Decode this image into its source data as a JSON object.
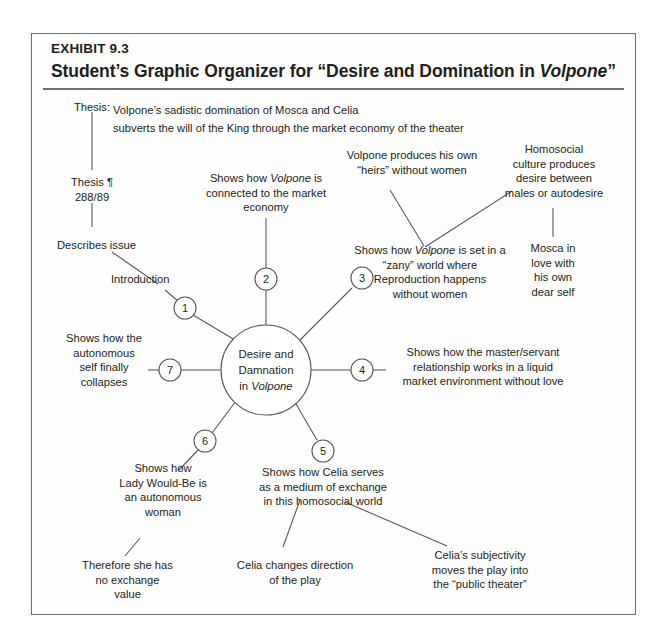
{
  "exhibit": {
    "label": "EXHIBIT 9.3",
    "title_prefix": "Student’s Graphic Organizer for “Desire and Domination in ",
    "title_italic": "Volpone",
    "title_suffix": "”"
  },
  "thesis": {
    "caption": "Thesis:",
    "text": "Volpone’s sadistic domination of Mosca and Celia\nsubverts the will of the King through the market economy of the theater"
  },
  "center": {
    "line1": "Desire and",
    "line2": "Damnation",
    "line3_prefix": "in ",
    "line3_italic": "Volpone"
  },
  "nodes": [
    {
      "num": "1",
      "label": "Introduction"
    },
    {
      "num": "2",
      "label": "Shows how Volpone is\nconnected to the market\neconomy"
    },
    {
      "num": "3",
      "label": "Shows how Volpone is set in a\n“zany” world where\nReproduction happens\nwithout women"
    },
    {
      "num": "4",
      "label": "Shows how the master/servant\nrelationship works in a liquid\nmarket environment without love"
    },
    {
      "num": "5",
      "label": "Shows how Celia serves\nas a medium of exchange\nin this homosocial world"
    },
    {
      "num": "6",
      "label": "Shows how\nLady Would-Be is\nan autonomous\nwoman"
    },
    {
      "num": "7",
      "label": "Shows how the\nautonomous\nself finally\ncollapses"
    }
  ],
  "labels": {
    "thesis_para": "Thesis ¶\n288/89",
    "describes_issue": "Describes issue",
    "introduction": "Introduction",
    "branch2_l1": "Shows how ",
    "branch2_i": "Volpone",
    "branch2_l2": " is",
    "branch2_rest": "connected to the market\neconomy",
    "volpone_heirs": "Volpone produces his own\n“heirs” without women",
    "homosocial": "Homosocial\nculture  produces\ndesire between\nmales or autodesire",
    "branch3_pre": "Shows how ",
    "branch3_i": "Volpone",
    "branch3_post": " is set in a",
    "branch3_rest": "“zany” world where\nReproduction happens\nwithout women",
    "mosca": "Mosca in\nlove with\nhis own\ndear self",
    "branch4": "Shows how the master/servant\nrelationship works in a liquid\nmarket environment without love",
    "branch5": "Shows how Celia serves\nas a medium of exchange\nin this homosocial world",
    "branch6": "Shows how\nLady Would-Be is\nan autonomous\nwoman",
    "branch7": "Shows how the\nautonomous\nself finally\ncollapses",
    "therefore": "Therefore she has\nno exchange\nvalue",
    "celia_changes": "Celia changes direction\nof the play",
    "celia_subjectivity": "Celia’s  subjectivity\nmoves the play into\nthe “public theater”"
  },
  "numbers": {
    "n1": "1",
    "n2": "2",
    "n3": "3",
    "n4": "4",
    "n5": "5",
    "n6": "6",
    "n7": "7"
  },
  "colors": {
    "ink": "#231f20",
    "rule": "#6d6e70",
    "stroke": "#58595b"
  }
}
